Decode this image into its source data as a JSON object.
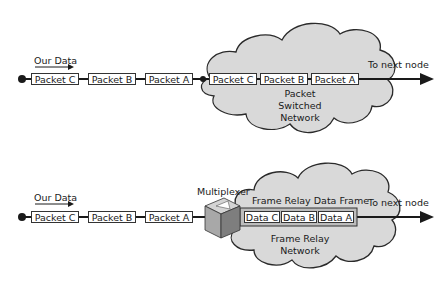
{
  "diagram": {
    "top": {
      "source_label": "Our Data",
      "input_packets": [
        "Packet C",
        "Packet B",
        "Packet A"
      ],
      "cloud_packets": [
        "Packet C",
        "Packet B",
        "Packet A"
      ],
      "cloud_label_line1": "Packet",
      "cloud_label_line2": "Switched",
      "cloud_label_line3": "Network",
      "output_label": "To next node"
    },
    "bottom": {
      "source_label": "Our Data",
      "input_packets": [
        "Packet C",
        "Packet B",
        "Packet A"
      ],
      "device_label": "Multiplexer",
      "frame_label": "Frame Relay Data Frame",
      "frame_data": [
        "Data C",
        "Data B",
        "Data A"
      ],
      "cloud_label_line1": "Frame Relay",
      "cloud_label_line2": "Network",
      "output_label": "To next node"
    },
    "colors": {
      "cloud_fill": "#d9d9d9",
      "cloud_stroke": "#2a2a2a",
      "line": "#1a1a1a",
      "box_fill": "#ffffff",
      "mux_light": "#c8c8c8",
      "mux_dark": "#8a8a8a"
    }
  }
}
